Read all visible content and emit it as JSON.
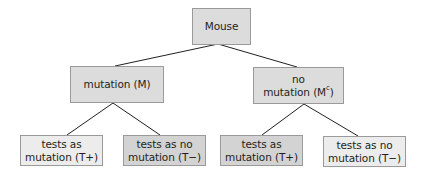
{
  "diagram": {
    "type": "tree",
    "root": {
      "label": "Mouse"
    },
    "level1": [
      {
        "id": "M",
        "line1": "mutation (M)"
      },
      {
        "id": "Mc",
        "line1": "no",
        "line2_prefix": "mutation (M",
        "line2_sup": "c",
        "line2_suffix": ")"
      }
    ],
    "level2": [
      {
        "parent": "M",
        "line1": "tests as",
        "line2": "mutation (T+)",
        "shade": "light"
      },
      {
        "parent": "M",
        "line1": "tests as no",
        "line2": "mutation (T−)",
        "shade": "dark"
      },
      {
        "parent": "Mc",
        "line1": "tests as",
        "line2": "mutation (T+)",
        "shade": "dark"
      },
      {
        "parent": "Mc",
        "line1": "tests as no",
        "line2": "mutation (T−)",
        "shade": "light"
      }
    ]
  },
  "colors": {
    "light_box": "#ececec",
    "mid_box": "#dcdcdc",
    "dark_box": "#d3d3d3",
    "border": "#9a9a9a",
    "line": "#231f20",
    "text": "#231f20"
  }
}
